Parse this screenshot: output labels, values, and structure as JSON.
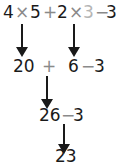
{
  "expression": {
    "line1": {
      "a": "4",
      "times1": "×",
      "b": "5",
      "plus": "+",
      "c": "2",
      "times2": "×",
      "d": "3",
      "minus": "−",
      "e": "3"
    },
    "line2": {
      "a": "20",
      "plus": "+",
      "b": "6",
      "minus": "−",
      "c": "3"
    },
    "line3": {
      "a": "26",
      "minus": "−",
      "b": "3"
    },
    "line4": {
      "result": "23"
    }
  },
  "colors": {
    "text": "#1a1a1a",
    "operator": "#8a8a8a",
    "dimmed": "#b5b5b5"
  }
}
